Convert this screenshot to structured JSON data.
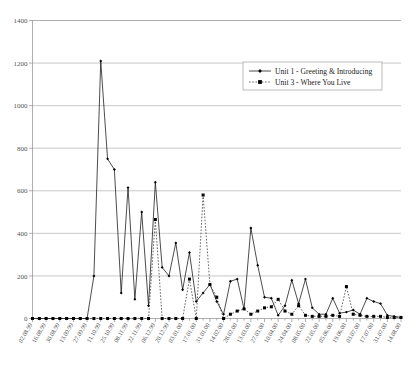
{
  "chart_data": {
    "type": "line",
    "title": "",
    "xlabel": "",
    "ylabel": "",
    "ylim": [
      0,
      1400
    ],
    "ytick_step": 200,
    "yticks": [
      0,
      200,
      400,
      600,
      800,
      1000,
      1200,
      1400
    ],
    "grid": true,
    "legend_position": "top-right",
    "x_tick_label_rotation": -60,
    "x_tick_label_interval": 2,
    "categories": [
      "02.08.99",
      "09.08.99",
      "16.08.99",
      "23.08.99",
      "30.08.99",
      "06.09.99",
      "13.09.99",
      "20.09.99",
      "27.09.99",
      "04.10.99",
      "11.10.99",
      "18.10.99",
      "25.10.99",
      "01.11.99",
      "08.11.99",
      "15.11.99",
      "22.11.99",
      "29.11.99",
      "06.12.99",
      "13.12.99",
      "20.12.99",
      "27.12.99",
      "03.01.00",
      "10.01.00",
      "17.01.00",
      "24.01.00",
      "31.01.00",
      "07.02.00",
      "14.02.00",
      "21.02.00",
      "28.02.00",
      "06.03.00",
      "13.03.00",
      "20.03.00",
      "27.03.00",
      "03.04.00",
      "10.04.00",
      "17.04.00",
      "24.04.00",
      "01.05.00",
      "08.05.00",
      "15.05.00",
      "22.05.00",
      "29.05.00",
      "05.06.00",
      "12.06.00",
      "19.06.00",
      "26.06.00",
      "03.07.00",
      "10.07.00",
      "17.07.00",
      "24.07.00",
      "31.07.00",
      "07.08.00",
      "14.08.00"
    ],
    "x_tick_labels": [
      "02.08.99",
      "16.08.99",
      "30.08.99",
      "13.09.99",
      "27.09.99",
      "11.10.99",
      "25.10.99",
      "08.11.99",
      "22.11.99",
      "06.12.99",
      "20.12.99",
      "03.01.00",
      "17.01.00",
      "31.01.00",
      "14.02.00",
      "28.02.00",
      "13.03.00",
      "27.03.00",
      "10.04.00",
      "24.04.00",
      "08.05.00",
      "22.05.00",
      "05.06.00",
      "19.06.00",
      "03.07.00",
      "17.07.00",
      "31.07.00",
      "14.08.00"
    ],
    "series": [
      {
        "name": "Unit 1 - Greeting & Introducing",
        "style": "solid",
        "marker": "diamond",
        "color": "#111111",
        "values": [
          0,
          0,
          0,
          0,
          0,
          0,
          0,
          0,
          0,
          200,
          1210,
          750,
          700,
          120,
          615,
          90,
          500,
          60,
          640,
          240,
          200,
          355,
          135,
          310,
          80,
          120,
          160,
          80,
          20,
          175,
          185,
          45,
          425,
          250,
          100,
          95,
          15,
          60,
          180,
          70,
          185,
          50,
          20,
          20,
          95,
          25,
          30,
          40,
          20,
          95,
          80,
          70,
          15,
          10,
          5
        ]
      },
      {
        "name": "Unit 3 - Where You Live",
        "style": "dotted",
        "marker": "square",
        "color": "#222222",
        "values": [
          0,
          0,
          0,
          0,
          0,
          0,
          0,
          0,
          0,
          0,
          0,
          0,
          0,
          0,
          0,
          0,
          0,
          0,
          465,
          0,
          0,
          0,
          0,
          185,
          0,
          580,
          160,
          100,
          0,
          20,
          35,
          45,
          20,
          35,
          50,
          55,
          90,
          35,
          20,
          60,
          15,
          10,
          10,
          10,
          15,
          10,
          150,
          20,
          15,
          10,
          10,
          10,
          5,
          5,
          5
        ]
      }
    ]
  },
  "legend": {
    "entries": [
      {
        "label": "Unit 1 - Greeting & Introducing"
      },
      {
        "label": "Unit 3 - Where You Live"
      }
    ]
  }
}
